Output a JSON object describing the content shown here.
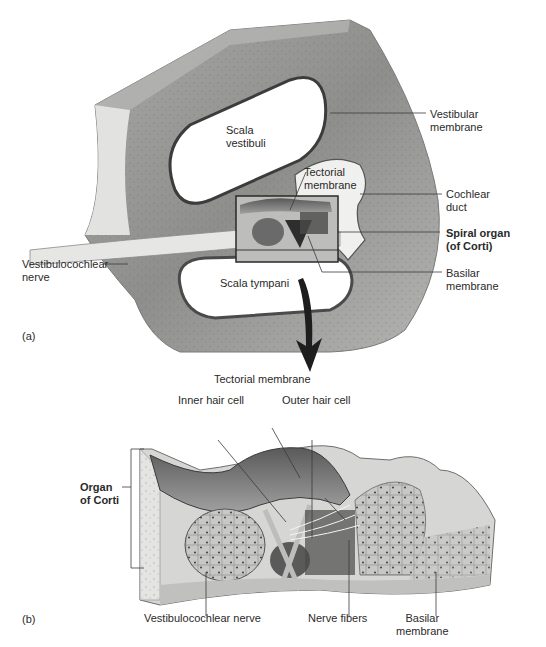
{
  "figure": {
    "panel_a": {
      "id": "(a)",
      "labels": {
        "scala_vestibuli": "Scala\nvestibuli",
        "vestibular_membrane": "Vestibular\nmembrane",
        "tectorial_membrane": "Tectorial\nmembrane",
        "cochlear_duct": "Cochlear\nduct",
        "spiral_organ": "Spiral organ\n(of Corti)",
        "vestibulocochlear_nerve": "Vestibulocochlear\nnerve",
        "scala_tympani": "Scala tympani",
        "basilar_membrane": "Basilar\nmembrane"
      }
    },
    "panel_b": {
      "id": "(b)",
      "labels": {
        "tectorial_membrane": "Tectorial membrane",
        "inner_hair_cell": "Inner hair cell",
        "outer_hair_cell": "Outer hair cell",
        "organ_of_corti": "Organ\nof Corti",
        "vestibulocochlear_nerve": "Vestibulocochlear nerve",
        "nerve_fibers": "Nerve fibers",
        "basilar_membrane": "Basilar\nmembrane"
      }
    },
    "colors": {
      "bone": "#9a9a9a",
      "bone_dark": "#6e6e6e",
      "tissue_light": "#d8d8d6",
      "line": "#3a3a3a",
      "text": "#2a2a2a"
    }
  }
}
